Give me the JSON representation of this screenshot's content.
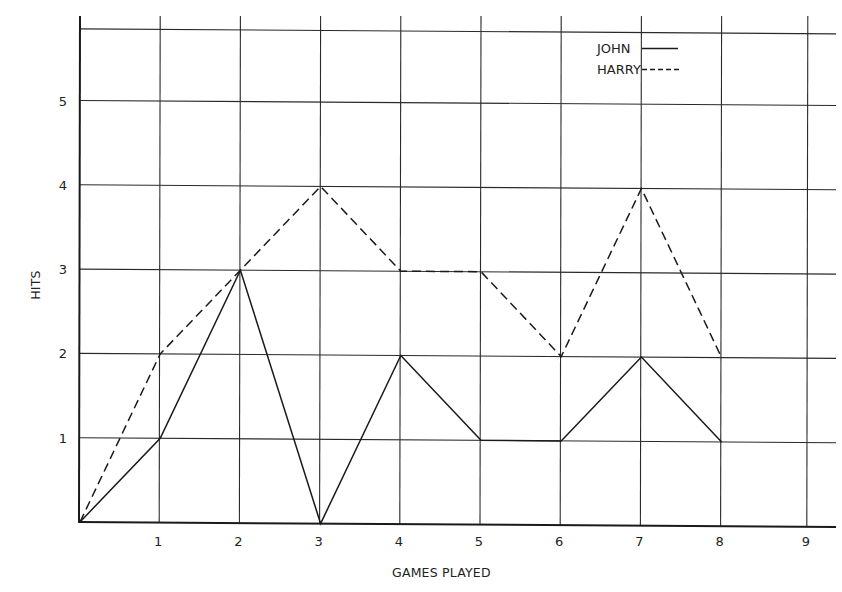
{
  "chart_data": {
    "type": "line",
    "title": "",
    "xlabel": "GAMES PLAYED",
    "ylabel": "HITS",
    "x": [
      0,
      1,
      2,
      3,
      4,
      5,
      6,
      7,
      8
    ],
    "x_ticks": [
      "1",
      "2",
      "3",
      "4",
      "5",
      "6",
      "7",
      "8",
      "9"
    ],
    "y_ticks": [
      "1",
      "2",
      "3",
      "4",
      "5"
    ],
    "xlim": [
      0,
      9.3
    ],
    "ylim": [
      0,
      5.85
    ],
    "grid": true,
    "legend_position": "top-right",
    "series": [
      {
        "name": "JOHN",
        "style": "solid",
        "values": [
          0,
          1,
          3,
          0,
          2,
          1,
          1,
          2,
          1
        ]
      },
      {
        "name": "HARRY",
        "style": "dashed",
        "values": [
          0,
          2,
          3,
          4,
          3,
          3,
          2,
          4,
          2
        ]
      }
    ]
  },
  "legend": {
    "items": [
      {
        "label": "JOHN",
        "style": "solid"
      },
      {
        "label": "HARRY",
        "style": "dashed"
      }
    ]
  },
  "colors": {
    "line": "#1a1a1a",
    "grid": "#2a2a2a",
    "background": "#ffffff"
  }
}
